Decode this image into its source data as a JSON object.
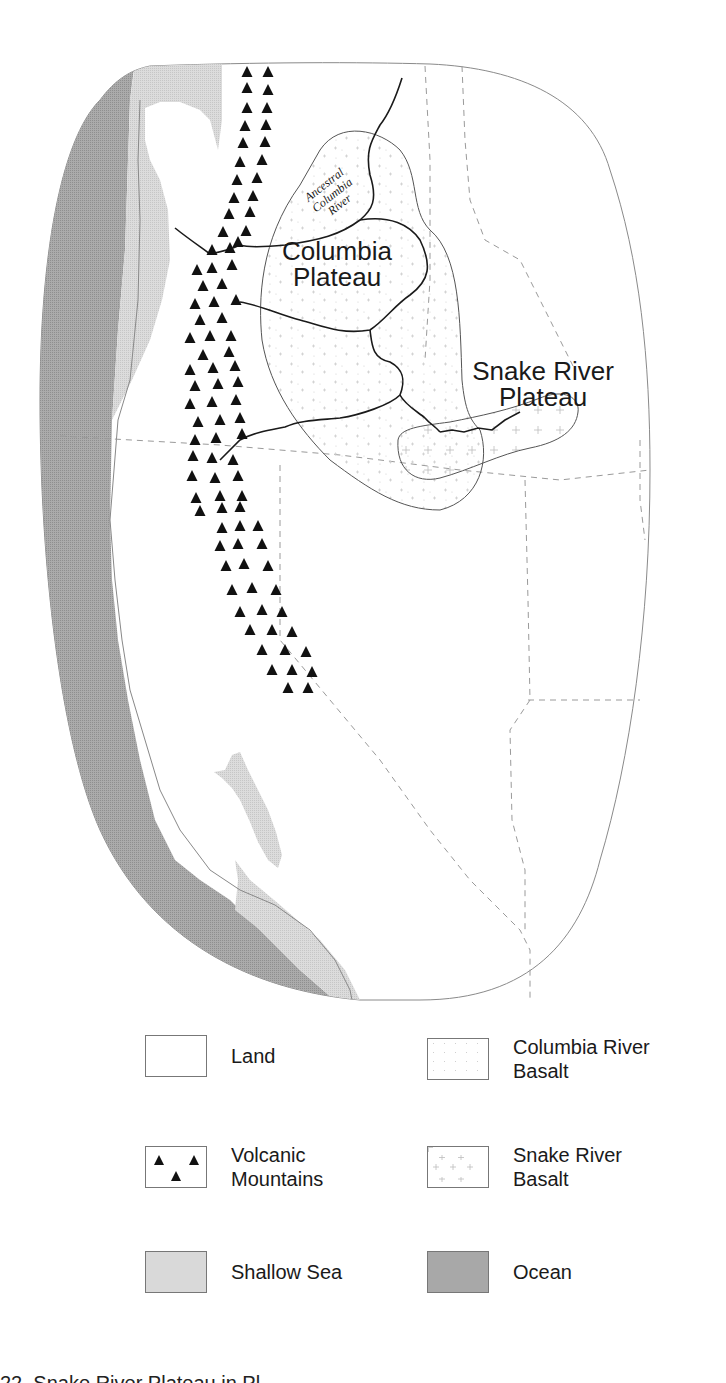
{
  "map": {
    "labels": {
      "ancestral_river": [
        "Ancestral",
        "Columbia",
        "River"
      ],
      "columbia_plateau": [
        "Columbia",
        "Plateau"
      ],
      "snake_river_plateau": [
        "Snake River",
        "Plateau"
      ]
    },
    "colors": {
      "land": "#ffffff",
      "shallow_sea": "#d9d9d9",
      "ocean": "#a8a8a8",
      "mountains": "#111111",
      "outline": "#555555",
      "rivers": "#1a1a1a",
      "state_borders_dashed": "#9a9a9a"
    }
  },
  "legend": {
    "items": [
      {
        "key": "land",
        "label": [
          "Land"
        ],
        "icon": "blank-swatch"
      },
      {
        "key": "columbia_river_basalt",
        "label": [
          "Columbia River",
          "Basalt"
        ],
        "icon": "speckle-swatch"
      },
      {
        "key": "volcanic_mountains",
        "label": [
          "Volcanic",
          "Mountains"
        ],
        "icon": "triangle-swatch"
      },
      {
        "key": "snake_river_basalt",
        "label": [
          "Snake River",
          "Basalt"
        ],
        "icon": "cross-hatch-swatch"
      },
      {
        "key": "shallow_sea",
        "label": [
          "Shallow Sea"
        ],
        "icon": "light-stipple-swatch"
      },
      {
        "key": "ocean",
        "label": [
          "Ocean"
        ],
        "icon": "dark-stipple-swatch"
      }
    ]
  },
  "caption": {
    "text": "22. Snake River Plateau in Pl"
  }
}
